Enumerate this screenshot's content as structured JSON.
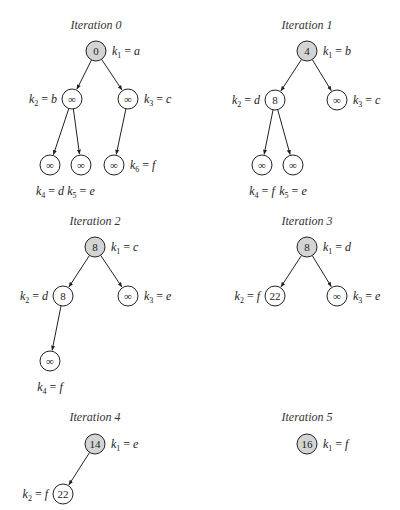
{
  "diagram": {
    "node_fill": {
      "root": "#d4d4d4",
      "other": "#ffffff"
    },
    "stroke_color": "#222222",
    "iterations": [
      {
        "title": "Iteration 0",
        "nodes": [
          {
            "id": "k1",
            "value": "0",
            "key": "k1",
            "letter": "a",
            "x": 96,
            "y": 51,
            "root": true,
            "label_side": "right"
          },
          {
            "id": "k2",
            "value": "∞",
            "key": "k2",
            "letter": "b",
            "x": 72,
            "y": 99,
            "label_side": "left"
          },
          {
            "id": "k3",
            "value": "∞",
            "key": "k3",
            "letter": "c",
            "x": 128,
            "y": 99,
            "label_side": "right"
          },
          {
            "id": "k4",
            "value": "∞",
            "key": "k4",
            "letter": "d",
            "x": 50,
            "y": 165,
            "label_side": "below"
          },
          {
            "id": "k5",
            "value": "∞",
            "key": "k5",
            "letter": "e",
            "x": 81,
            "y": 165,
            "label_side": "below"
          },
          {
            "id": "k6",
            "value": "∞",
            "key": "k6",
            "letter": "f",
            "x": 114,
            "y": 165,
            "label_side": "right"
          }
        ],
        "edges": [
          [
            "k1",
            "k2"
          ],
          [
            "k1",
            "k3"
          ],
          [
            "k2",
            "k4"
          ],
          [
            "k2",
            "k5"
          ],
          [
            "k3",
            "k6"
          ]
        ],
        "title_pos": {
          "x": 96,
          "y": 29
        }
      },
      {
        "title": "Iteration 1",
        "nodes": [
          {
            "id": "k1",
            "value": "4",
            "key": "k1",
            "letter": "b",
            "x": 307,
            "y": 51,
            "root": true,
            "label_side": "right"
          },
          {
            "id": "k2",
            "value": "8",
            "key": "k2",
            "letter": "d",
            "x": 275,
            "y": 100,
            "label_side": "left"
          },
          {
            "id": "k3",
            "value": "∞",
            "key": "k3",
            "letter": "c",
            "x": 337,
            "y": 100,
            "label_side": "right"
          },
          {
            "id": "k4",
            "value": "∞",
            "key": "k4",
            "letter": "f",
            "x": 262,
            "y": 165,
            "label_side": "below"
          },
          {
            "id": "k5",
            "value": "∞",
            "key": "k5",
            "letter": "e",
            "x": 293,
            "y": 165,
            "label_side": "below"
          }
        ],
        "edges": [
          [
            "k1",
            "k2"
          ],
          [
            "k1",
            "k3"
          ],
          [
            "k2",
            "k4"
          ],
          [
            "k2",
            "k5"
          ]
        ],
        "title_pos": {
          "x": 307,
          "y": 29
        }
      },
      {
        "title": "Iteration 2",
        "nodes": [
          {
            "id": "k1",
            "value": "8",
            "key": "k1",
            "letter": "c",
            "x": 95,
            "y": 247,
            "root": true,
            "label_side": "right"
          },
          {
            "id": "k2",
            "value": "8",
            "key": "k2",
            "letter": "d",
            "x": 63,
            "y": 296,
            "label_side": "left"
          },
          {
            "id": "k3",
            "value": "∞",
            "key": "k3",
            "letter": "e",
            "x": 128,
            "y": 296,
            "label_side": "right"
          },
          {
            "id": "k4",
            "value": "∞",
            "key": "k4",
            "letter": "f",
            "x": 50,
            "y": 361,
            "label_side": "below"
          }
        ],
        "edges": [
          [
            "k1",
            "k2"
          ],
          [
            "k1",
            "k3"
          ],
          [
            "k2",
            "k4"
          ]
        ],
        "title_pos": {
          "x": 95,
          "y": 225
        }
      },
      {
        "title": "Iteration 3",
        "nodes": [
          {
            "id": "k1",
            "value": "8",
            "key": "k1",
            "letter": "d",
            "x": 307,
            "y": 247,
            "root": true,
            "label_side": "right"
          },
          {
            "id": "k2",
            "value": "22",
            "key": "k2",
            "letter": "f",
            "x": 275,
            "y": 296,
            "label_side": "left"
          },
          {
            "id": "k3",
            "value": "∞",
            "key": "k3",
            "letter": "e",
            "x": 337,
            "y": 296,
            "label_side": "right"
          }
        ],
        "edges": [
          [
            "k1",
            "k2"
          ],
          [
            "k1",
            "k3"
          ]
        ],
        "title_pos": {
          "x": 307,
          "y": 225
        }
      },
      {
        "title": "Iteration 4",
        "nodes": [
          {
            "id": "k1",
            "value": "14",
            "key": "k1",
            "letter": "e",
            "x": 95,
            "y": 444,
            "root": true,
            "label_side": "right"
          },
          {
            "id": "k2",
            "value": "22",
            "key": "k2",
            "letter": "f",
            "x": 63,
            "y": 494,
            "label_side": "left"
          }
        ],
        "edges": [
          [
            "k1",
            "k2"
          ]
        ],
        "title_pos": {
          "x": 95,
          "y": 421
        }
      },
      {
        "title": "Iteration 5",
        "nodes": [
          {
            "id": "k1",
            "value": "16",
            "key": "k1",
            "letter": "f",
            "x": 307,
            "y": 444,
            "root": true,
            "label_side": "right"
          }
        ],
        "edges": [],
        "title_pos": {
          "x": 307,
          "y": 421
        }
      }
    ]
  }
}
